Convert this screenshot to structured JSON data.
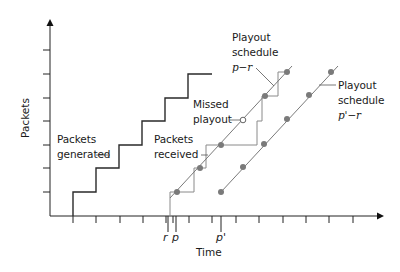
{
  "diagram": {
    "type": "playout-delay-timeline",
    "axes": {
      "x_label": "Time",
      "y_label": "Packets",
      "x_tick_labels": {
        "r": "r",
        "p": "p",
        "p_prime": "p'"
      }
    },
    "labels": {
      "packets_generated": [
        "Packets",
        "generated"
      ],
      "packets_received": [
        "Packets",
        "received"
      ],
      "missed_playout": [
        "Missed",
        "playout"
      ],
      "playout_schedule_1": [
        "Playout",
        "schedule",
        "p−r"
      ],
      "playout_schedule_2": [
        "Playout",
        "schedule",
        "p'−r"
      ]
    },
    "colors": {
      "axis": "#222222",
      "generated_line": "#2a2a2a",
      "received_line": "#8a8a8a",
      "schedule_line": "#7a7a7a",
      "dot": "#7a7a7a",
      "missed_dot_fill": "#ffffff"
    },
    "series": {
      "packets_generated": [
        [
          73,
          216
        ],
        [
          73,
          192
        ],
        [
          96,
          192
        ],
        [
          96,
          168
        ],
        [
          119,
          168
        ],
        [
          119,
          145
        ],
        [
          142,
          145
        ],
        [
          142,
          121
        ],
        [
          165,
          121
        ],
        [
          165,
          98
        ],
        [
          188,
          98
        ],
        [
          188,
          74
        ],
        [
          212,
          74
        ]
      ],
      "packets_received": [
        [
          170,
          216
        ],
        [
          170,
          192
        ],
        [
          194,
          192
        ],
        [
          194,
          168
        ],
        [
          206,
          168
        ],
        [
          206,
          145
        ],
        [
          257,
          145
        ],
        [
          257,
          121
        ],
        [
          262,
          121
        ],
        [
          262,
          96
        ],
        [
          278,
          96
        ],
        [
          278,
          72
        ],
        [
          287,
          72
        ]
      ],
      "playout_schedule_p_minus_r": {
        "line": [
          [
            170,
            198
          ],
          [
            292,
            66
          ]
        ],
        "points": [
          [
            177,
            192
          ],
          [
            200,
            168
          ],
          [
            221,
            145
          ],
          [
            265,
            96
          ],
          [
            287,
            72
          ]
        ],
        "missed": [
          243,
          120
        ]
      },
      "playout_schedule_p_prime_minus_r": {
        "line": [
          [
            221,
            192
          ],
          [
            338,
            66
          ]
        ],
        "points": [
          [
            221,
            192
          ],
          [
            243,
            167
          ],
          [
            264,
            144
          ],
          [
            287,
            119
          ],
          [
            309,
            95
          ],
          [
            331,
            72
          ]
        ]
      }
    },
    "y_ticks": [
      50,
      74,
      98,
      121,
      145,
      168,
      192
    ],
    "x_ticks": [
      73,
      96,
      120,
      143,
      166,
      173,
      189,
      212,
      236,
      259,
      283,
      306,
      329,
      353
    ]
  }
}
